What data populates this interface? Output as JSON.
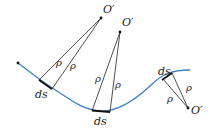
{
  "diagram": {
    "colors": {
      "curve": "#3d7fc4",
      "line": "#222222",
      "ds": "#111111"
    },
    "labels": {
      "center_1": "O′",
      "center_2": "O′",
      "center_3": "O′",
      "rho": "ρ",
      "ds": "ds"
    },
    "groups": [
      {
        "center": "O′",
        "radius_label": "ρ",
        "arc_label": "ds"
      },
      {
        "center": "O′",
        "radius_label": "ρ",
        "arc_label": "ds"
      },
      {
        "center": "O′",
        "radius_label": "ρ",
        "arc_label": "ds"
      }
    ]
  }
}
